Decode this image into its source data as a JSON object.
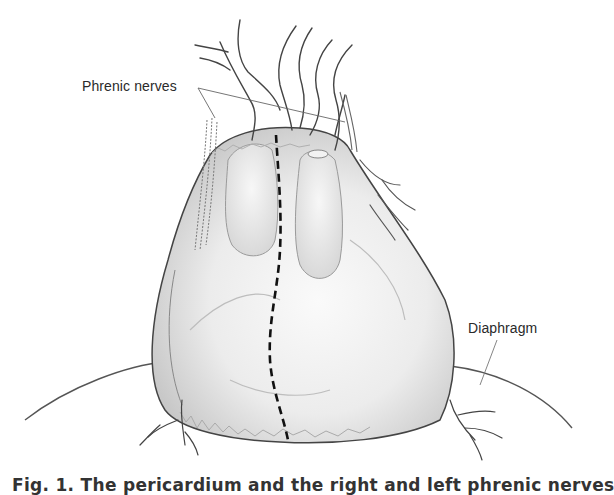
{
  "figure": {
    "labels": {
      "phrenic_nerves": "Phrenic nerves",
      "diaphragm": "Diaphragm"
    },
    "caption": "Fig. 1. The pericardium and the right and left phrenic nerves",
    "annotations": {
      "incision_line": "dashed vertical incision line",
      "pointer_lines": "leader lines from labels to structures"
    },
    "colors": {
      "background": "#ffffff",
      "ink": "#2a2a2a",
      "shading": "#d9d9d9"
    }
  }
}
